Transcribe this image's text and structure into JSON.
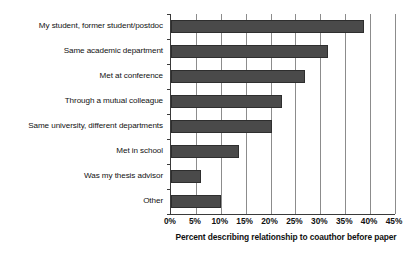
{
  "chart_data": {
    "type": "bar",
    "orientation": "horizontal",
    "title": "",
    "xlabel": "Percent describing relationship to coauthor before paper",
    "ylabel": "",
    "xlim": [
      0,
      45
    ],
    "xtick_step": 5,
    "xticks": [
      0,
      5,
      10,
      15,
      20,
      25,
      30,
      35,
      40,
      45
    ],
    "xtick_labels": [
      "0%",
      "5%",
      "10%",
      "15%",
      "20%",
      "25%",
      "30%",
      "35%",
      "40%",
      "45%"
    ],
    "grid": true,
    "grid_axis": "x",
    "legend": false,
    "categories": [
      "My student, former student/postdoc",
      "Same academic department",
      "Met at conference",
      "Through a mutual colleague",
      "Same university, different departments",
      "Met in school",
      "Was my thesis advisor",
      "Other"
    ],
    "values": [
      38.8,
      31.5,
      27.0,
      22.3,
      20.2,
      13.7,
      6.0,
      10.0
    ],
    "value_unit": "%",
    "bar_color": "#4a4a4a",
    "bar_border_color": "#2e2e2e",
    "gridline_color": "#8c8c8c",
    "axis_color": "#3a3a3a",
    "background_color": "#ffffff"
  }
}
